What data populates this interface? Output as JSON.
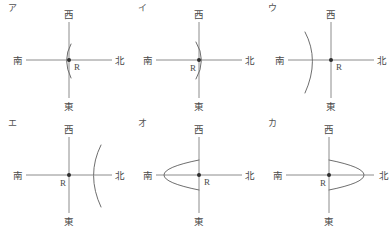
{
  "figure": {
    "background_color": "#ffffff",
    "line_color": "#808080",
    "arc_color": "#6e6e6e",
    "dot_color": "#2e2e2e",
    "text_color": "#4a4a4a",
    "columns": 3,
    "rows": 2,
    "directions": {
      "top": "西",
      "bottom": "東",
      "left": "南",
      "right": "北"
    },
    "center_point_label": "R",
    "panels": [
      {
        "id": "a",
        "label": "ア",
        "directions": {
          "top": "西",
          "bottom": "東",
          "left": "南",
          "right": "北"
        },
        "center_label": "R",
        "arc": {
          "description": "small arc bulging toward 南 (left), opening toward 北",
          "size": "small",
          "bulge_direction": "left",
          "opening_direction": "right",
          "position_relative_to_R": "at-center"
        }
      },
      {
        "id": "i",
        "label": "イ",
        "directions": {
          "top": "西",
          "bottom": "東",
          "left": "南",
          "right": "北"
        },
        "center_label": "R",
        "arc": {
          "description": "small arc bulging toward 北 (right), opening toward 南",
          "size": "small",
          "bulge_direction": "right",
          "opening_direction": "left",
          "position_relative_to_R": "at-center"
        }
      },
      {
        "id": "u",
        "label": "ウ",
        "directions": {
          "top": "西",
          "bottom": "東",
          "left": "南",
          "right": "北"
        },
        "center_label": "R",
        "arc": {
          "description": "large arc bulging toward 北 (right), located left of R",
          "size": "large",
          "bulge_direction": "right",
          "opening_direction": "left",
          "position_relative_to_R": "left"
        }
      },
      {
        "id": "e",
        "label": "エ",
        "directions": {
          "top": "西",
          "bottom": "東",
          "left": "南",
          "right": "北"
        },
        "center_label": "R",
        "arc": {
          "description": "large arc bulging toward 南 (left), located right of R",
          "size": "large",
          "bulge_direction": "left",
          "opening_direction": "right",
          "position_relative_to_R": "right"
        }
      },
      {
        "id": "o",
        "label": "オ",
        "directions": {
          "top": "西",
          "bottom": "東",
          "left": "南",
          "right": "北"
        },
        "center_label": "R",
        "arc": {
          "description": "wide parabolic curve with vertex toward 南 (left), both endpoints meeting at R",
          "size": "wide",
          "bulge_direction": "left",
          "opening_direction": "right",
          "position_relative_to_R": "left-endpoints-at-R"
        }
      },
      {
        "id": "ka",
        "label": "カ",
        "directions": {
          "top": "西",
          "bottom": "東",
          "left": "南",
          "right": "北"
        },
        "center_label": "R",
        "arc": {
          "description": "wide parabolic curve with vertex toward 北 (right), both endpoints meeting at R",
          "size": "wide",
          "bulge_direction": "right",
          "opening_direction": "left",
          "position_relative_to_R": "right-endpoints-at-R"
        }
      }
    ]
  }
}
